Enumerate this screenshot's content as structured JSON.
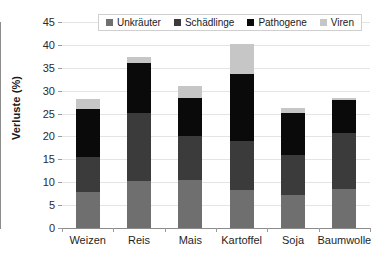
{
  "chart_data": {
    "type": "bar",
    "stacked": true,
    "title": "",
    "xlabel": "",
    "ylabel": "Verluste (%)",
    "ylim": [
      0,
      45
    ],
    "ytick_step": 5,
    "yticks": [
      0,
      5,
      10,
      15,
      20,
      25,
      30,
      35,
      40,
      45
    ],
    "grid": true,
    "legend_position": "top-center",
    "categories": [
      "Weizen",
      "Reis",
      "Mais",
      "Kartoffel",
      "Soja",
      "Baumwolle"
    ],
    "series": [
      {
        "name": "Unkräuter",
        "color": "#706f6f",
        "values": [
          7.8,
          10.2,
          10.4,
          8.4,
          7.3,
          8.6
        ]
      },
      {
        "name": "Schädlinge",
        "color": "#3b3b3b",
        "values": [
          7.7,
          15.0,
          9.6,
          10.6,
          8.7,
          12.1
        ]
      },
      {
        "name": "Pathogene",
        "color": "#0a0a0a",
        "values": [
          10.5,
          10.8,
          8.5,
          14.6,
          9.1,
          7.3
        ]
      },
      {
        "name": "Viren",
        "color": "#c6c6c6",
        "values": [
          2.2,
          1.3,
          2.5,
          6.6,
          1.1,
          0.3
        ]
      }
    ],
    "totals": [
      28.2,
      37.3,
      31.0,
      40.2,
      26.2,
      28.3
    ]
  }
}
